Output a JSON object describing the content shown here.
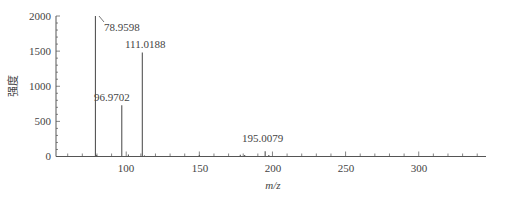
{
  "chart_data": {
    "type": "bar",
    "subtype": "mass-spectrum-stick",
    "title": "",
    "xlabel": "m/z",
    "ylabel": "强度",
    "xlim": [
      52,
      346
    ],
    "ylim": [
      0,
      2000
    ],
    "grid": false,
    "legend": null,
    "x_ticks": [
      100,
      150,
      200,
      250,
      300
    ],
    "y_ticks": [
      0,
      500,
      1000,
      1500,
      2000
    ],
    "peaks": [
      {
        "mz": 78.9598,
        "intensity": 2000,
        "label": "78.9598"
      },
      {
        "mz": 96.9702,
        "intensity": 730,
        "label": "96.9702"
      },
      {
        "mz": 111.0188,
        "intensity": 1480,
        "label": "111.0188"
      },
      {
        "mz": 195.0079,
        "intensity": 75,
        "label": "195.0079"
      }
    ],
    "minor_peaks": [
      {
        "mz": 79.8,
        "intensity": 20
      },
      {
        "mz": 101.5,
        "intensity": 30
      },
      {
        "mz": 112.5,
        "intensity": 15
      },
      {
        "mz": 150.0,
        "intensity": 20
      },
      {
        "mz": 178.0,
        "intensity": 25
      },
      {
        "mz": 181.0,
        "intensity": 20
      },
      {
        "mz": 197.5,
        "intensity": 20
      }
    ]
  },
  "labels": {
    "x_axis": "m/z",
    "y_axis": "强度",
    "peak_1": "78.9598",
    "peak_2": "96.9702",
    "peak_3": "111.0188",
    "peak_4": "195.0079",
    "y0": "0",
    "y500": "500",
    "y1000": "1000",
    "y1500": "1500",
    "y2000": "2000",
    "x100": "100",
    "x150": "150",
    "x200": "200",
    "x250": "250",
    "x300": "300"
  }
}
